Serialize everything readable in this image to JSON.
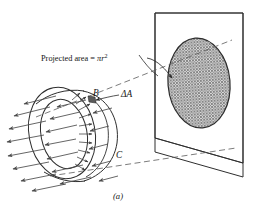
{
  "figure": {
    "caption": "(a)",
    "projected_area_label": {
      "text_prefix": "Projected area = ",
      "symbol_pi": "π",
      "symbol_r": "r",
      "exponent": "2",
      "full_text": "Projected area = πr²"
    },
    "point_labels": [
      {
        "name": "point-b",
        "text": "B"
      },
      {
        "name": "point-c",
        "text": "C"
      },
      {
        "name": "element-delta-a",
        "text": "ΔA"
      }
    ],
    "colors": {
      "ink": "#1a1a1a",
      "line": "#3a3a3a",
      "arrow": "#4a4a4a",
      "hatch": "#8c8c8c",
      "hatch_bg": "#d6d6d6",
      "background": "#ffffff",
      "dashed": "#5a5a5a"
    },
    "elements": {
      "plane": "projection-plane",
      "disc": "projected-area-disc",
      "cylinder": "cylinder-body",
      "field": "radiation-field-arrows",
      "normals": "surface-normal-arrows",
      "projection_rays": "dashed-projection-lines",
      "leader": "label-leader-arrow"
    }
  }
}
